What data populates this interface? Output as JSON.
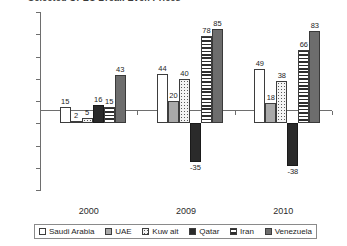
{
  "chart_data": {
    "type": "bar",
    "title": "Selected OPEC Break-Even Prices",
    "xlabel": "",
    "ylabel": "",
    "ylim": [
      -60,
      100
    ],
    "yticks": [
      100,
      80,
      60,
      40,
      20,
      0,
      -20,
      -40,
      -60
    ],
    "ytick_labels": [
      "$100",
      "$80",
      "$60",
      "$40",
      "$20",
      "$0",
      "-$20",
      "-$40",
      "-$60"
    ],
    "categories": [
      "2000",
      "2009",
      "2010"
    ],
    "grid": false,
    "legend_position": "bottom",
    "series": [
      {
        "name": "Saudi Arabia",
        "fill": "white",
        "values": [
          15,
          44,
          49
        ]
      },
      {
        "name": "UAE",
        "fill": "gray",
        "values": [
          2,
          20,
          18
        ]
      },
      {
        "name": "Kuw ait",
        "fill": "dots",
        "values": [
          5,
          40,
          38
        ]
      },
      {
        "name": "Qatar",
        "fill": "black",
        "values": [
          16,
          -35,
          -38
        ]
      },
      {
        "name": "Iran",
        "fill": "stripe",
        "values": [
          15,
          78,
          66
        ]
      },
      {
        "name": "Venezuela",
        "fill": "dgray",
        "values": [
          43,
          85,
          83
        ]
      }
    ]
  },
  "colors": {
    "axis": "#6e6e6e",
    "text": "#1d1d1d",
    "white": "#ffffff",
    "gray": "#a9a9a9",
    "black": "#2a2a2a",
    "dark_gray": "#6d6d6d"
  }
}
